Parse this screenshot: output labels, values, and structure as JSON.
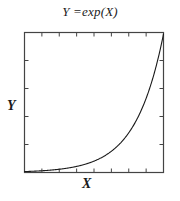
{
  "chart_data": {
    "type": "line",
    "title": "Y =exp(X)",
    "xlabel": "X",
    "ylabel": "Y",
    "grid": false,
    "legend": false,
    "axis_tick_labels_shown": false,
    "xlim": [
      0,
      5
    ],
    "ylim": [
      0,
      150
    ],
    "frame": "box",
    "tick_direction": "in",
    "x_major_ticks": [
      0,
      0.625,
      1.25,
      1.875,
      2.5,
      3.125,
      3.75,
      4.375,
      5
    ],
    "y_major_ticks": [
      0,
      30,
      60,
      90,
      120,
      150
    ],
    "series": [
      {
        "name": "Y =exp(X)",
        "color": "#1a1a1a",
        "x": [
          0.0,
          0.25,
          0.5,
          0.75,
          1.0,
          1.25,
          1.5,
          1.75,
          2.0,
          2.25,
          2.5,
          2.75,
          3.0,
          3.25,
          3.5,
          3.75,
          4.0,
          4.25,
          4.5,
          4.75,
          5.0
        ],
        "y": [
          1.0,
          1.28,
          1.65,
          2.12,
          2.72,
          3.49,
          4.48,
          5.75,
          7.39,
          9.49,
          12.18,
          15.64,
          20.09,
          25.79,
          33.12,
          42.52,
          54.6,
          70.11,
          90.02,
          115.58,
          148.41
        ]
      }
    ]
  },
  "figure": {
    "background": "#ffffff",
    "line_color": "#1a1a1a",
    "axis_color": "#444444"
  }
}
